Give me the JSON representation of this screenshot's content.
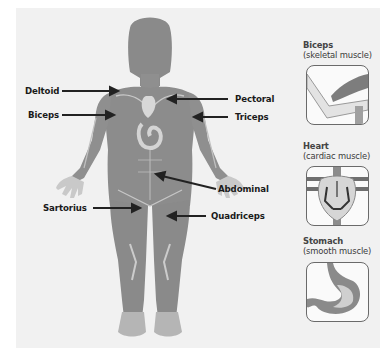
{
  "diagram": {
    "figure_labels": [
      {
        "id": "deltoid",
        "text": "Deltoid",
        "side": "left"
      },
      {
        "id": "biceps",
        "text": "Biceps",
        "side": "left"
      },
      {
        "id": "pectoral",
        "text": "Pectoral",
        "side": "right"
      },
      {
        "id": "triceps",
        "text": "Triceps",
        "side": "right"
      },
      {
        "id": "abdominal",
        "text": "Abdominal",
        "side": "right"
      },
      {
        "id": "sartorius",
        "text": "Sartorius",
        "side": "left"
      },
      {
        "id": "quadriceps",
        "text": "Quadriceps",
        "side": "right"
      }
    ],
    "insets": [
      {
        "id": "biceps",
        "title": "Biceps",
        "subtitle": "(skeletal muscle)",
        "icon": "biceps-skeletal-muscle-icon"
      },
      {
        "id": "heart",
        "title": "Heart",
        "subtitle": "(cardiac muscle)",
        "icon": "heart-cardiac-muscle-icon"
      },
      {
        "id": "stomach",
        "title": "Stomach",
        "subtitle": "(smooth muscle)",
        "icon": "stomach-smooth-muscle-icon"
      }
    ],
    "colors": {
      "body": "#8c8c8c",
      "body_dark": "#777777",
      "highlight": "#cfcfcf",
      "arrow": "#222222",
      "panel": "#f1f1f1"
    }
  }
}
